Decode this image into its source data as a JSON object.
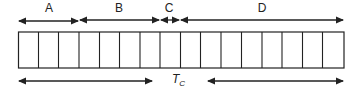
{
  "diagram": {
    "segments": [
      {
        "label": "A",
        "x1": 18,
        "x2": 79
      },
      {
        "label": "B",
        "x1": 79,
        "x2": 160
      },
      {
        "label": "C",
        "x1": 160,
        "x2": 180
      },
      {
        "label": "D",
        "x1": 180,
        "x2": 344
      }
    ],
    "box": {
      "x": 18,
      "y": 32,
      "width": 326,
      "height": 36,
      "cells": 16
    },
    "cycle_label": {
      "main": "T",
      "sub": "C"
    },
    "cycle_arrows": [
      {
        "x1": 18,
        "x2": 152
      },
      {
        "x1": 207,
        "x2": 344
      }
    ],
    "colors": {
      "stroke": "#222222",
      "background": "#ffffff"
    }
  }
}
